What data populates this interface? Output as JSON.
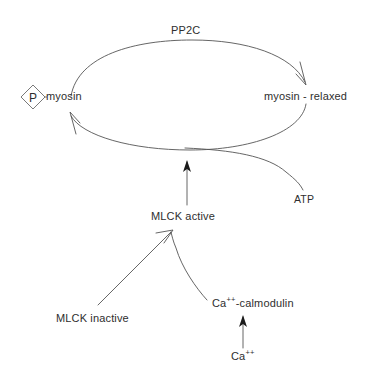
{
  "diagram": {
    "background_color": "#ffffff",
    "stroke_color": "#4a4a4a",
    "text_color": "#2e2e2e",
    "nodes": {
      "phosphate_symbol": "P",
      "myosin_phosphorylated": "myosin",
      "myosin_relaxed": "myosin - relaxed",
      "phosphatase": "PP2C",
      "atp": "ATP",
      "mlck_active": "MLCK active",
      "mlck_inactive": "MLCK inactive",
      "ca_calmodulin_prefix": "Ca",
      "ca_calmodulin_sup": "++",
      "ca_calmodulin_suffix": "-calmodulin",
      "calcium_prefix": "Ca",
      "calcium_sup": "++"
    }
  }
}
